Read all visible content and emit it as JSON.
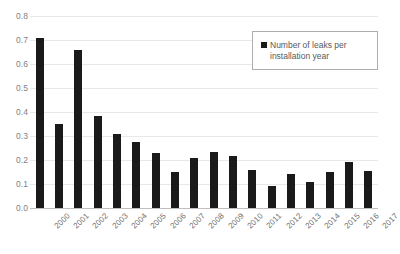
{
  "chart_data": {
    "type": "bar",
    "title": "",
    "xlabel": "",
    "ylabel": "",
    "ylim": [
      0.0,
      0.8
    ],
    "grid": true,
    "legend_position": "top-right",
    "legend": [
      "Number of leaks per installation year"
    ],
    "y_ticks": [
      "0.8",
      "0.7",
      "0.6",
      "0.5",
      "0.4",
      "0.3",
      "0.2",
      "0.1",
      "0.0"
    ],
    "y_tick_values": [
      0.8,
      0.7,
      0.6,
      0.5,
      0.4,
      0.3,
      0.2,
      0.1,
      0.0
    ],
    "categories": [
      "2000",
      "2001",
      "2002",
      "2003",
      "2004",
      "2005",
      "2006",
      "2007",
      "2008",
      "2009",
      "2010",
      "2011",
      "2012",
      "2013",
      "2014",
      "2015",
      "2016",
      "2017"
    ],
    "series": [
      {
        "name": "Number of leaks per installation year",
        "color": "#1a1a1a",
        "values": [
          0.71,
          0.35,
          0.66,
          0.385,
          0.308,
          0.277,
          0.229,
          0.152,
          0.207,
          0.232,
          0.218,
          0.159,
          0.09,
          0.141,
          0.107,
          0.148,
          0.19,
          0.153
        ]
      }
    ]
  },
  "legend": {
    "label": "Number of leaks per installation year",
    "marker": "square-marker"
  },
  "colors": {
    "bar": "#1a1a1a",
    "gridline": "#e8e8e8",
    "axis_text": "#7f7f7f",
    "legend_border": "#adadad",
    "background": "#ffffff"
  }
}
